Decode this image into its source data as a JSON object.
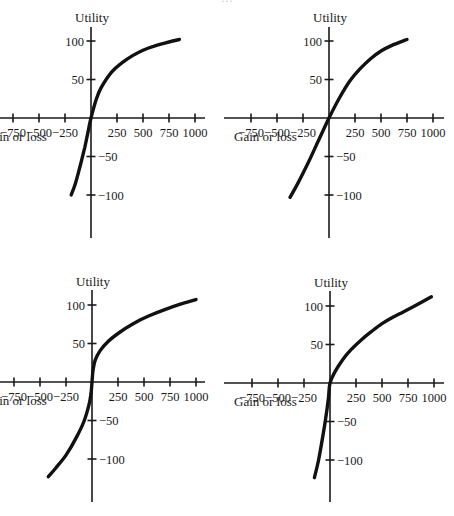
{
  "page": {
    "caption_partial": "…"
  },
  "chart_data": [
    {
      "id": "top-left",
      "type": "line",
      "title": "",
      "ylabel": "Utility",
      "xlabel": "Gain or loss",
      "x_ticks": [
        -750,
        -500,
        -250,
        250,
        500,
        750,
        1000
      ],
      "x_tick_labels": [
        "−750",
        "−500",
        "−250",
        "250",
        "500",
        "750",
        "1000"
      ],
      "y_ticks": [
        100,
        50,
        -50,
        -100
      ],
      "y_tick_labels": [
        "100",
        "50",
        "−50",
        "−100"
      ],
      "xlim": [
        -850,
        1100
      ],
      "ylim": [
        -155,
        120
      ],
      "grid": false,
      "legend": null,
      "series": [
        {
          "name": "utility curve",
          "x": [
            -190,
            -150,
            -100,
            -60,
            -30,
            0,
            50,
            100,
            200,
            300,
            400,
            500,
            600,
            700,
            850
          ],
          "y": [
            -100,
            -85,
            -60,
            -38,
            -19,
            0,
            24,
            40,
            60,
            72,
            81,
            88,
            93,
            97,
            102
          ]
        }
      ]
    },
    {
      "id": "top-right",
      "type": "line",
      "title": "",
      "ylabel": "Utility",
      "xlabel": "Gain or loss",
      "x_ticks": [
        -750,
        -500,
        -250,
        250,
        500,
        750,
        1000
      ],
      "x_tick_labels": [
        "−750",
        "−500",
        "−250",
        "250",
        "500",
        "750",
        "1000"
      ],
      "y_ticks": [
        100,
        50,
        -50,
        -100
      ],
      "y_tick_labels": [
        "100",
        "50",
        "−50",
        "−100"
      ],
      "xlim": [
        -850,
        1100
      ],
      "ylim": [
        -155,
        120
      ],
      "grid": false,
      "legend": null,
      "series": [
        {
          "name": "utility curve",
          "x": [
            -375,
            -300,
            -200,
            -100,
            0,
            100,
            200,
            300,
            400,
            500,
            600,
            750
          ],
          "y": [
            -103,
            -85,
            -58,
            -29,
            0,
            26,
            48,
            64,
            77,
            87,
            94,
            102
          ]
        }
      ]
    },
    {
      "id": "bottom-left",
      "type": "line",
      "title": "",
      "ylabel": "Utility",
      "xlabel": "Gain or loss",
      "x_ticks": [
        -750,
        -500,
        -250,
        250,
        500,
        750,
        1000
      ],
      "x_tick_labels": [
        "−750",
        "−500",
        "−250",
        "250",
        "500",
        "750",
        "1000"
      ],
      "y_ticks": [
        100,
        50,
        -50,
        -100
      ],
      "y_tick_labels": [
        "100",
        "50",
        "−50",
        "−100"
      ],
      "xlim": [
        -850,
        1100
      ],
      "ylim": [
        -155,
        120
      ],
      "grid": false,
      "legend": null,
      "series": [
        {
          "name": "utility curve",
          "x": [
            -420,
            -350,
            -250,
            -150,
            -80,
            -30,
            -10,
            0,
            10,
            30,
            80,
            150,
            250,
            400,
            550,
            700,
            850,
            1000
          ],
          "y": [
            -123,
            -112,
            -95,
            -72,
            -52,
            -30,
            -15,
            0,
            15,
            28,
            41,
            52,
            63,
            76,
            86,
            94,
            101,
            107
          ]
        }
      ]
    },
    {
      "id": "bottom-right",
      "type": "line",
      "title": "",
      "ylabel": "Utility",
      "xlabel": "Gain or loss",
      "x_ticks": [
        -750,
        -500,
        -250,
        250,
        500,
        750,
        1000
      ],
      "x_tick_labels": [
        "−750",
        "−500",
        "−250",
        "250",
        "500",
        "750",
        "1000"
      ],
      "y_ticks": [
        100,
        50,
        -50,
        -100
      ],
      "y_tick_labels": [
        "100",
        "50",
        "−50",
        "−100"
      ],
      "xlim": [
        -850,
        1100
      ],
      "ylim": [
        -155,
        120
      ],
      "grid": false,
      "legend": null,
      "series": [
        {
          "name": "utility curve",
          "x": [
            -150,
            -110,
            -70,
            -40,
            -15,
            0,
            50,
            120,
            200,
            300,
            400,
            500,
            600,
            700,
            800,
            975
          ],
          "y": [
            -123,
            -100,
            -70,
            -45,
            -20,
            0,
            15,
            30,
            43,
            56,
            67,
            77,
            85,
            92,
            99,
            112
          ]
        }
      ]
    }
  ],
  "panels_layout": [
    {
      "origin_px": [
        91,
        118
      ],
      "px_per_250x": 26,
      "px_per_50y": 38.5,
      "axis_x_px": [
        -6,
        205
      ],
      "axis_y_px": [
        27,
        238
      ],
      "ylabel_px": [
        92,
        22
      ],
      "xlabel_px": [
        -16,
        141
      ]
    },
    {
      "origin_px": [
        329,
        118
      ],
      "px_per_250x": 26,
      "px_per_50y": 38.5,
      "axis_x_px": [
        224,
        444
      ],
      "axis_y_px": [
        27,
        238
      ],
      "ylabel_px": [
        330,
        22
      ],
      "xlabel_px": [
        234,
        141
      ]
    },
    {
      "origin_px": [
        92,
        382
      ],
      "px_per_250x": 26,
      "px_per_50y": 38.5,
      "axis_x_px": [
        -6,
        205
      ],
      "axis_y_px": [
        290,
        502
      ],
      "ylabel_px": [
        93,
        286
      ],
      "xlabel_px": [
        -16,
        405
      ]
    },
    {
      "origin_px": [
        330,
        383
      ],
      "px_per_250x": 26,
      "px_per_50y": 38.5,
      "axis_x_px": [
        224,
        444
      ],
      "axis_y_px": [
        291,
        502
      ],
      "ylabel_px": [
        331,
        287
      ],
      "xlabel_px": [
        234,
        406
      ]
    }
  ]
}
